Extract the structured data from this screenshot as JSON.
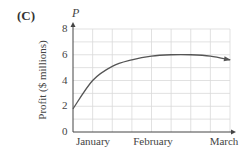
{
  "figure": {
    "panel_label": "(C)",
    "y_variable": "P"
  },
  "chart_data": {
    "type": "line",
    "title": "",
    "xlabel": "",
    "ylabel": "Profit ($ millions)",
    "y_variable": "P",
    "ylim": [
      0,
      8
    ],
    "yticks": [
      0,
      2,
      4,
      6,
      8
    ],
    "xticks_labels": [
      "January",
      "February",
      "March"
    ],
    "grid": true,
    "x": [
      0,
      0.25,
      0.5,
      0.75,
      1.0,
      1.25,
      1.5,
      1.75,
      2.0
    ],
    "series": [
      {
        "name": "Profit",
        "values": [
          1.8,
          4.0,
          5.1,
          5.6,
          5.9,
          6.0,
          6.0,
          5.9,
          5.6
        ]
      }
    ],
    "colors": {
      "curve": "#555555",
      "grid": "#d9d9d9",
      "axis": "#444444"
    }
  }
}
